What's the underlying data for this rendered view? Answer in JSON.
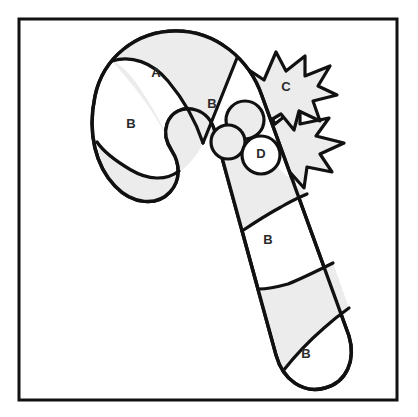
{
  "figure": {
    "style": "line-art coloring page",
    "canvas": {
      "width": 418,
      "height": 417,
      "background": "#ffffff"
    },
    "palette": {
      "outline": "#111111",
      "shaded_fill": "#ececec",
      "plain_fill": "#ffffff",
      "label_text": "#2b2b2b",
      "frame_stroke": "#111111"
    },
    "frame": {
      "name": "border-frame",
      "x": 19,
      "y": 19,
      "width": 378,
      "height": 381,
      "stroke_width": 3
    },
    "labels": [
      {
        "id": "label-a-hook-stripe",
        "text": "A",
        "x": 156,
        "y": 74
      },
      {
        "id": "label-b-hook-outer",
        "text": "B",
        "x": 131,
        "y": 125
      },
      {
        "id": "label-b-hook-inner",
        "text": "B",
        "x": 212,
        "y": 105
      },
      {
        "id": "label-c-holly-upper",
        "text": "C",
        "x": 286,
        "y": 88
      },
      {
        "id": "label-d-berry-front",
        "text": "D",
        "x": 261,
        "y": 155
      },
      {
        "id": "label-b-shaft-upper",
        "text": "B",
        "x": 268,
        "y": 241
      },
      {
        "id": "label-b-shaft-lower",
        "text": "B",
        "x": 306,
        "y": 355
      }
    ],
    "parts": [
      {
        "id": "cane-hook",
        "name": "candy-cane-hook",
        "fill": "plain"
      },
      {
        "id": "cane-shaft",
        "name": "candy-cane-shaft",
        "fill": "plain"
      },
      {
        "id": "stripe-a",
        "name": "cane-stripe-a",
        "fill": "shaded"
      },
      {
        "id": "stripe-hook-tip",
        "name": "cane-stripe-hook-tip",
        "fill": "shaded"
      },
      {
        "id": "stripe-shaft-top",
        "name": "cane-stripe-shaft-top",
        "fill": "shaded"
      },
      {
        "id": "stripe-shaft-mid",
        "name": "cane-stripe-shaft-mid",
        "fill": "shaded"
      },
      {
        "id": "holly-leaf-upper",
        "name": "holly-leaf-upper",
        "fill": "shaded",
        "label": "C"
      },
      {
        "id": "holly-leaf-lower",
        "name": "holly-leaf-lower",
        "fill": "shaded"
      },
      {
        "id": "berry-top",
        "name": "holly-berry-top",
        "fill": "shaded"
      },
      {
        "id": "berry-left",
        "name": "holly-berry-left",
        "fill": "shaded"
      },
      {
        "id": "berry-front",
        "name": "holly-berry-front",
        "fill": "plain",
        "label": "D"
      }
    ]
  }
}
